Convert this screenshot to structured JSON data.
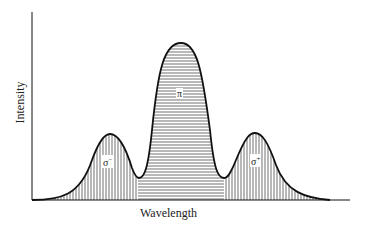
{
  "axes": {
    "xlabel": "Wavelength",
    "ylabel": "Intensity"
  },
  "peaks": [
    {
      "name": "sigma-minus",
      "label": "σ",
      "sup": "−",
      "hatch": "vertical"
    },
    {
      "name": "pi",
      "label": "π",
      "sup": "",
      "hatch": "horizontal"
    },
    {
      "name": "sigma-plus",
      "label": "σ",
      "sup": "+",
      "hatch": "vertical"
    }
  ],
  "colors": {
    "line": "#111111",
    "hatch": "#333333",
    "background": "#ffffff"
  }
}
